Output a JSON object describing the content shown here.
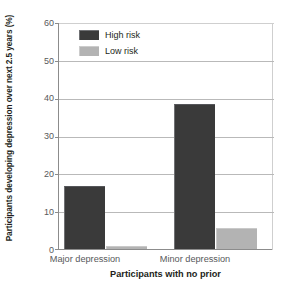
{
  "chart_data": {
    "type": "bar",
    "title": "",
    "subtitle": "",
    "xlabel": "Participants with no prior",
    "ylabel": "Participants developing depression over next 2.5 years (%)",
    "categories": [
      "Major depression",
      "Minor depression"
    ],
    "series": [
      {
        "name": "High risk",
        "color": "#3a3a3a",
        "values": [
          16.8,
          38.5
        ]
      },
      {
        "name": "Low risk",
        "color": "#b3b3b3",
        "values": [
          0.7,
          5.6
        ]
      }
    ],
    "ylim": [
      0,
      60
    ],
    "yticks": [
      0,
      10,
      20,
      30,
      40,
      50,
      60
    ],
    "ytick_labels": [
      "0",
      "10",
      "20",
      "30",
      "40",
      "50",
      "60"
    ],
    "grid": true,
    "legend_position": "upper left (inside plot)",
    "legend_entries": [
      "High risk",
      "Low risk"
    ]
  },
  "axis": {
    "y_title": "Participants developing depression over next 2.5 years (%)",
    "x_title": "Participants with no prior",
    "y_ticks": [
      "60",
      "50",
      "40",
      "30",
      "20",
      "10",
      "0"
    ]
  },
  "legend": {
    "items": [
      {
        "label": "High risk",
        "color": "#3a3a3a"
      },
      {
        "label": "Low risk",
        "color": "#b3b3b3"
      }
    ]
  },
  "categories": [
    {
      "label": "Major depression"
    },
    {
      "label": "Minor depression"
    }
  ],
  "colors": {
    "high_risk": "#3a3a3a",
    "low_risk": "#b3b3b3",
    "axis": "#8c8c8c",
    "gridline": "#b9b9b9",
    "tick_text": "#58595b",
    "title_text": "#231f20",
    "background": "#ffffff"
  }
}
